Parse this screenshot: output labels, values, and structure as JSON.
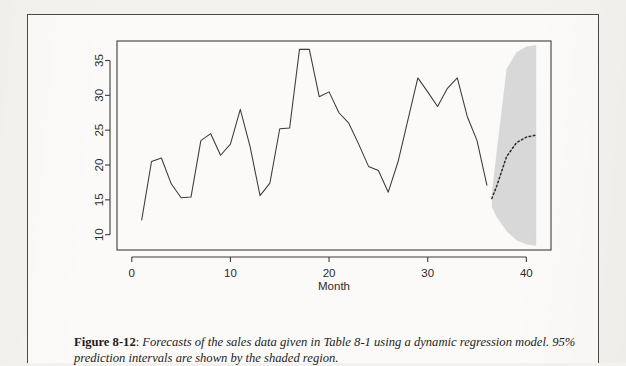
{
  "figure": {
    "caption_label": "Figure 8-12",
    "caption_separator": ":",
    "caption_text": "Forecasts of the sales data given in Table 8-1 using a dynamic regression model. 95% prediction intervals are shown by the shaded region."
  },
  "chart_data": {
    "type": "line",
    "title": "",
    "xlabel": "Month",
    "ylabel": "",
    "xlim": [
      -1.5,
      42.5
    ],
    "ylim": [
      7.8,
      37.8
    ],
    "xticks": [
      0,
      10,
      20,
      30,
      40
    ],
    "yticks": [
      10,
      15,
      20,
      25,
      30,
      35
    ],
    "xtick_labels": [
      "0",
      "10",
      "20",
      "30",
      "40"
    ],
    "ytick_labels": [
      "10",
      "15",
      "20",
      "25",
      "30",
      "35"
    ],
    "grid": false,
    "legend": null,
    "series": [
      {
        "name": "Observed sales",
        "style": "solid",
        "color": "#3a3a3a",
        "x": [
          1,
          2,
          3,
          4,
          5,
          6,
          7,
          8,
          9,
          10,
          11,
          12,
          13,
          14,
          15,
          16,
          17,
          18,
          19,
          20,
          21,
          22,
          23,
          24,
          25,
          26,
          27,
          28,
          29,
          30,
          31,
          32,
          33,
          34,
          35,
          36
        ],
        "values": [
          12.1,
          20.5,
          21.0,
          17.3,
          15.3,
          15.4,
          23.5,
          24.5,
          21.4,
          23.0,
          28.0,
          22.6,
          15.6,
          17.4,
          25.2,
          25.3,
          36.6,
          36.6,
          29.8,
          30.5,
          27.5,
          26.0,
          23.0,
          19.8,
          19.2,
          16.1,
          20.5,
          26.5,
          32.5,
          30.5,
          28.4,
          31.0,
          32.5,
          27.0,
          23.5,
          17.1
        ]
      },
      {
        "name": "Forecast",
        "style": "dotted",
        "color": "#2b2b2b",
        "x": [
          36.5,
          37,
          38,
          39,
          40,
          41
        ],
        "values": [
          15.2,
          17.0,
          21.2,
          23.2,
          24.0,
          24.3
        ]
      }
    ],
    "interval": {
      "name": "95% prediction interval",
      "fill": "#d4d4d4",
      "x": [
        36.5,
        37,
        38,
        39,
        40,
        41
      ],
      "lower": [
        14.0,
        12.5,
        10.5,
        9.2,
        8.6,
        8.4
      ],
      "upper": [
        15.9,
        22.0,
        33.8,
        36.2,
        37.0,
        37.2
      ]
    }
  }
}
